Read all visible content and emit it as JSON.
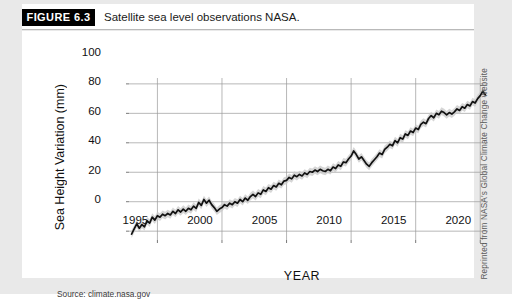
{
  "figure": {
    "badge_label": "FIGURE 6.3",
    "caption": "Satellite sea level observations NASA.",
    "source_note": "Source: climate.nasa.gov",
    "credit": "Reprinted from NASA's Global Climate Change website"
  },
  "colors": {
    "page_background": "#e9e9e9",
    "card_background": "#ffffff",
    "badge_background": "#000000",
    "badge_text": "#ffffff",
    "line": "#111111",
    "uncertainty_band": "#c8c8c8",
    "gridline": "#9a9a9a",
    "axis_text": "#111111"
  },
  "chart_data": {
    "type": "line",
    "title": "Satellite sea level observations NASA.",
    "xlabel": "YEAR",
    "ylabel": "Sea Height Variation (mm)",
    "xlim": [
      1992.8,
      2020.6
    ],
    "ylim": [
      -6,
      104
    ],
    "grid": true,
    "legend": "none",
    "xticks": [
      1995,
      2000,
      2005,
      2010,
      2015,
      2020
    ],
    "yticks": [
      0,
      20,
      40,
      60,
      80,
      100
    ],
    "series": [
      {
        "name": "Sea Height Variation",
        "units": "mm",
        "has_uncertainty_band": true,
        "band_half_width": 2.6,
        "x": [
          1993.0,
          1993.2,
          1993.4,
          1993.6,
          1993.8,
          1994.0,
          1994.2,
          1994.4,
          1994.6,
          1994.8,
          1995.0,
          1995.2,
          1995.4,
          1995.6,
          1995.8,
          1996.0,
          1996.2,
          1996.4,
          1996.6,
          1996.8,
          1997.0,
          1997.2,
          1997.4,
          1997.6,
          1997.8,
          1998.0,
          1998.2,
          1998.4,
          1998.6,
          1998.8,
          1999.0,
          1999.2,
          1999.4,
          1999.6,
          1999.8,
          2000.0,
          2000.2,
          2000.4,
          2000.6,
          2000.8,
          2001.0,
          2001.2,
          2001.4,
          2001.6,
          2001.8,
          2002.0,
          2002.2,
          2002.4,
          2002.6,
          2002.8,
          2003.0,
          2003.2,
          2003.4,
          2003.6,
          2003.8,
          2004.0,
          2004.2,
          2004.4,
          2004.6,
          2004.8,
          2005.0,
          2005.2,
          2005.4,
          2005.6,
          2005.8,
          2006.0,
          2006.2,
          2006.4,
          2006.6,
          2006.8,
          2007.0,
          2007.2,
          2007.4,
          2007.6,
          2007.8,
          2008.0,
          2008.2,
          2008.4,
          2008.6,
          2008.8,
          2009.0,
          2009.2,
          2009.4,
          2009.6,
          2009.8,
          2010.0,
          2010.2,
          2010.4,
          2010.6,
          2010.8,
          2011.0,
          2011.2,
          2011.4,
          2011.6,
          2011.8,
          2012.0,
          2012.2,
          2012.4,
          2012.6,
          2012.8,
          2013.0,
          2013.2,
          2013.4,
          2013.6,
          2013.8,
          2014.0,
          2014.2,
          2014.4,
          2014.6,
          2014.8,
          2015.0,
          2015.2,
          2015.4,
          2015.6,
          2015.8,
          2016.0,
          2016.2,
          2016.4,
          2016.6,
          2016.8,
          2017.0,
          2017.2,
          2017.4,
          2017.6,
          2017.8,
          2018.0,
          2018.2,
          2018.4,
          2018.6,
          2018.8,
          2019.0,
          2019.2,
          2019.4,
          2019.6,
          2019.8,
          2020.0,
          2020.2,
          2020.4
        ],
        "y": [
          -2.0,
          1.5,
          5.0,
          2.0,
          4.5,
          3.0,
          7.0,
          5.5,
          9.5,
          7.5,
          10.5,
          9.5,
          11.5,
          10.5,
          12.0,
          11.0,
          13.5,
          12.0,
          14.5,
          13.0,
          15.0,
          13.5,
          15.5,
          14.5,
          17.0,
          15.5,
          19.5,
          17.5,
          21.5,
          19.0,
          21.0,
          18.0,
          16.0,
          13.5,
          15.0,
          16.0,
          18.0,
          17.0,
          19.0,
          18.0,
          20.0,
          19.0,
          21.5,
          20.0,
          22.5,
          21.0,
          23.5,
          25.0,
          23.5,
          26.0,
          25.0,
          28.0,
          27.0,
          29.5,
          28.5,
          31.0,
          30.0,
          32.5,
          31.5,
          34.0,
          34.5,
          36.5,
          35.5,
          38.0,
          37.0,
          38.5,
          37.5,
          39.5,
          38.5,
          40.5,
          40.0,
          41.5,
          40.5,
          42.0,
          41.0,
          40.5,
          42.0,
          41.0,
          43.5,
          42.5,
          45.0,
          44.0,
          47.0,
          46.5,
          49.0,
          51.0,
          54.5,
          52.0,
          49.0,
          50.5,
          48.0,
          45.5,
          44.0,
          46.5,
          48.5,
          50.5,
          53.0,
          52.0,
          55.5,
          57.0,
          59.0,
          58.0,
          61.5,
          60.0,
          63.5,
          62.5,
          66.0,
          65.0,
          68.0,
          67.0,
          70.0,
          69.0,
          72.5,
          74.0,
          73.0,
          76.5,
          78.5,
          77.0,
          80.0,
          79.0,
          81.5,
          80.5,
          79.0,
          80.5,
          79.5,
          81.0,
          83.0,
          82.0,
          84.5,
          83.5,
          86.0,
          85.0,
          88.0,
          87.0,
          90.0,
          92.0,
          95.0,
          92.5
        ]
      }
    ],
    "annotations": [
      {
        "text": "Source: climate.nasa.gov",
        "position": "below-axis-left"
      }
    ]
  },
  "axis": {
    "y_ticks": [
      "100",
      "80",
      "60",
      "40",
      "20",
      "0"
    ],
    "x_ticks": [
      "1995",
      "2000",
      "2005",
      "2010",
      "2015",
      "2020"
    ],
    "x_title": "YEAR",
    "y_title": "Sea Height Variation (mm)"
  }
}
